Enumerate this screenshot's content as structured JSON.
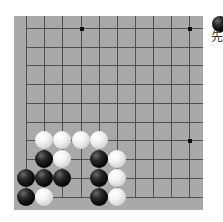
{
  "problem": {
    "to_move_label": "先",
    "to_move_color": "black"
  },
  "board": {
    "background": "#a9a9a9",
    "line_color": "#505050",
    "columns": 10,
    "rows": 10,
    "col_x": [
      26,
      44,
      62,
      81,
      99,
      117,
      135,
      153,
      171,
      189
    ],
    "row_y": [
      28,
      47,
      65,
      84,
      103,
      122,
      140,
      159,
      178,
      197
    ],
    "edges": {
      "left": true,
      "bottom": true,
      "top": false,
      "right": false
    },
    "star_points": [
      {
        "col": 3,
        "row": 0
      },
      {
        "col": 9,
        "row": 0
      },
      {
        "col": 9,
        "row": 6
      }
    ],
    "stones": [
      {
        "color": "white",
        "col": 1,
        "row": 6
      },
      {
        "color": "white",
        "col": 2,
        "row": 6
      },
      {
        "color": "white",
        "col": 3,
        "row": 6
      },
      {
        "color": "white",
        "col": 4,
        "row": 6
      },
      {
        "color": "black",
        "col": 1,
        "row": 7
      },
      {
        "color": "white",
        "col": 2,
        "row": 7
      },
      {
        "color": "black",
        "col": 4,
        "row": 7
      },
      {
        "color": "white",
        "col": 5,
        "row": 7
      },
      {
        "color": "black",
        "col": 0,
        "row": 8
      },
      {
        "color": "black",
        "col": 1,
        "row": 8
      },
      {
        "color": "black",
        "col": 2,
        "row": 8
      },
      {
        "color": "black",
        "col": 4,
        "row": 8
      },
      {
        "color": "white",
        "col": 5,
        "row": 8
      },
      {
        "color": "black",
        "col": 0,
        "row": 9
      },
      {
        "color": "white",
        "col": 1,
        "row": 9
      },
      {
        "color": "black",
        "col": 4,
        "row": 9
      },
      {
        "color": "white",
        "col": 5,
        "row": 9
      }
    ]
  }
}
